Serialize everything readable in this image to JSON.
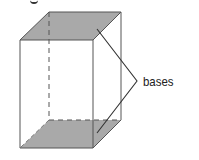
{
  "diagram": {
    "type": "rectangular prism",
    "label": "bases",
    "colors": {
      "fill": "#a9a9a9",
      "edge": "#555555",
      "text": "#222222"
    },
    "top_face": [
      [
        49,
        12
      ],
      [
        121,
        12
      ],
      [
        93,
        40
      ],
      [
        20,
        40
      ]
    ],
    "bottom_face": [
      [
        49,
        120
      ],
      [
        121,
        120
      ],
      [
        93,
        148
      ],
      [
        20,
        148
      ]
    ],
    "hidden_edges": [
      [
        [
          49,
          12
        ],
        [
          49,
          120
        ]
      ],
      [
        [
          49,
          120
        ],
        [
          121,
          120
        ]
      ],
      [
        [
          49,
          120
        ],
        [
          20,
          148
        ]
      ]
    ],
    "leader": [
      [
        97,
        29
      ],
      [
        137,
        81
      ],
      [
        97,
        133
      ]
    ]
  }
}
